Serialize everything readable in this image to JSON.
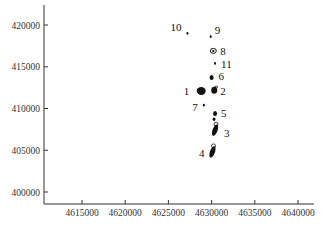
{
  "chart_data": {
    "type": "scatter",
    "title": "",
    "xlabel": "",
    "ylabel": "",
    "xlim": [
      4611000,
      4641000
    ],
    "ylim": [
      398500,
      422000
    ],
    "grid": false,
    "legend": null,
    "x_ticks": [
      4615000,
      4620000,
      4625000,
      4630000,
      4635000,
      4640000
    ],
    "x_tick_labels": [
      "4615000",
      "4620000",
      "4625000",
      "4630000",
      "4635000",
      "4640000"
    ],
    "y_ticks": [
      400000,
      405000,
      410000,
      415000,
      420000
    ],
    "y_tick_labels": [
      "400000",
      "405000",
      "410000",
      "415000",
      "420000"
    ],
    "points": [
      {
        "label": "1",
        "x": 4628800,
        "y": 412100,
        "size": "large"
      },
      {
        "label": "2",
        "x": 4630300,
        "y": 412200,
        "size": "medium"
      },
      {
        "label": "3",
        "x": 4630400,
        "y": 407400,
        "size": "elongated"
      },
      {
        "label": "4",
        "x": 4630100,
        "y": 404800,
        "size": "elongated"
      },
      {
        "label": "5",
        "x": 4630400,
        "y": 409400,
        "size": "small"
      },
      {
        "label": "6",
        "x": 4630000,
        "y": 413700,
        "size": "small"
      },
      {
        "label": "7",
        "x": 4629100,
        "y": 410400,
        "size": "tiny"
      },
      {
        "label": "8",
        "x": 4630200,
        "y": 416900,
        "size": "small-contour"
      },
      {
        "label": "9",
        "x": 4629900,
        "y": 418600,
        "size": "tiny"
      },
      {
        "label": "10",
        "x": 4627200,
        "y": 419000,
        "size": "tiny"
      },
      {
        "label": "11",
        "x": 4630400,
        "y": 415400,
        "size": "tiny"
      }
    ]
  },
  "colors": {
    "axis": "#333333",
    "marker": "#111111",
    "background": "#ffffff"
  }
}
